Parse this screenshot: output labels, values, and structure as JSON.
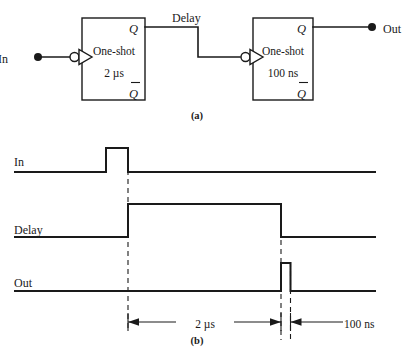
{
  "figure": {
    "panel_a": {
      "caption": "(a)",
      "input_terminal_label": "In",
      "output_terminal_label": "Out",
      "interconnect_label": "Delay",
      "blocks": [
        {
          "name": "One-shot",
          "duration": "2 µs",
          "q_label": "Q",
          "qbar_label": "Q",
          "trigger": "inverting"
        },
        {
          "name": "One-shot",
          "duration": "100 ns",
          "q_label": "Q",
          "qbar_label": "Q",
          "trigger": "inverting"
        }
      ]
    },
    "panel_b": {
      "caption": "(b)",
      "signals": [
        {
          "label": "In"
        },
        {
          "label": "Delay"
        },
        {
          "label": "Out"
        }
      ],
      "dimensions": [
        {
          "label": "2 µs"
        },
        {
          "label": "100 ns"
        }
      ]
    },
    "colors": {
      "ink": "#1a1a1a",
      "paper": "#ffffff"
    }
  }
}
